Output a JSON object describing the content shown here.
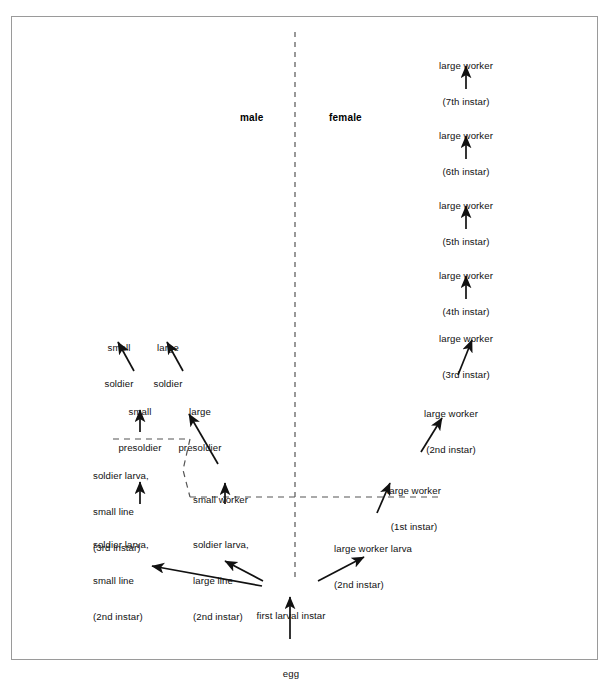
{
  "figure": {
    "type": "developmental-pathway-diagram",
    "title": "",
    "caste_determination_flow": true
  },
  "divider_labels": {
    "male": "male",
    "female": "female"
  },
  "nodes": {
    "egg": {
      "line1": "egg",
      "line2": ""
    },
    "first_larval_instar": {
      "line1": "first larval instar",
      "line2": ""
    },
    "soldier_larva_small_2": {
      "line1": "soldier larva,",
      "line2": "small line",
      "line3": "(2nd instar)"
    },
    "soldier_larva_small_3": {
      "line1": "soldier larva,",
      "line2": "small line",
      "line3": "(3rd instar)"
    },
    "soldier_larva_large_2": {
      "line1": "soldier larva,",
      "line2": "large line",
      "line3": "(2nd instar)"
    },
    "small_worker": {
      "line1": "small worker",
      "line2": ""
    },
    "small_presoldier": {
      "line1": "small",
      "line2": "presoldier"
    },
    "large_presoldier": {
      "line1": "large",
      "line2": "presoldier"
    },
    "small_soldier": {
      "line1": "small",
      "line2": "soldier"
    },
    "large_soldier": {
      "line1": "large",
      "line2": "soldier"
    },
    "large_worker_larva_2": {
      "line1": "large worker larva",
      "line2": "(2nd instar)"
    },
    "large_worker_1": {
      "line1": "large worker",
      "line2": "(1st instar)"
    },
    "large_worker_2": {
      "line1": "large worker",
      "line2": "(2nd instar)"
    },
    "large_worker_3": {
      "line1": "large worker",
      "line2": "(3rd instar)"
    },
    "large_worker_4": {
      "line1": "large worker",
      "line2": "(4th instar)"
    },
    "large_worker_5": {
      "line1": "large worker",
      "line2": "(5th instar)"
    },
    "large_worker_6": {
      "line1": "large worker",
      "line2": "(6th instar)"
    },
    "large_worker_7": {
      "line1": "large worker",
      "line2": "(7th instar)"
    }
  },
  "colors": {
    "ink": "#111111",
    "frame": "#9a9a9a",
    "dashed": "#444444",
    "background": "#ffffff"
  }
}
